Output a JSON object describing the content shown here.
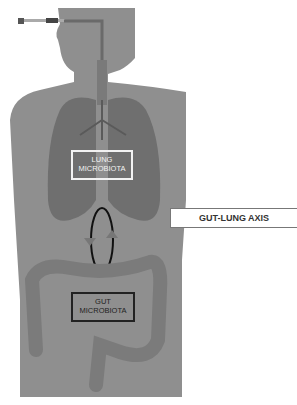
{
  "figure": {
    "title": "Gut-Lung Axis",
    "colors": {
      "body": "#8f8f8f",
      "lungs": "#6f6f6f",
      "intestine": "#7d7d7d",
      "background": "#ffffff"
    }
  },
  "labels": {
    "lung": "LUNG MICROBIOTA",
    "axis": "GUT-LUNG AXIS",
    "gut": "GUT MICROBIOTA"
  }
}
